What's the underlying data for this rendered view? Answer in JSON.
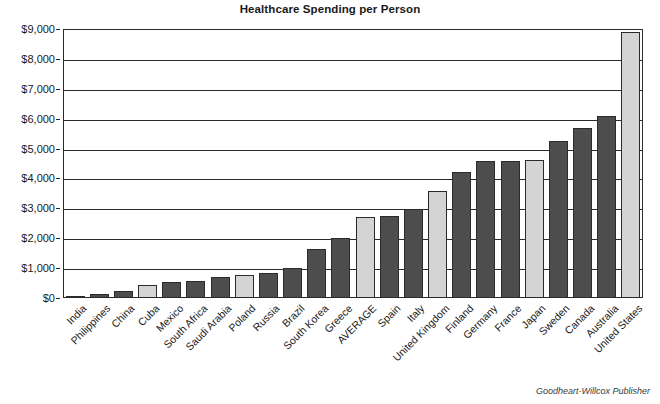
{
  "chart_data": {
    "type": "bar",
    "title": "Healthcare Spending per Person",
    "xlabel": "",
    "ylabel": "",
    "ylim": [
      0,
      9000
    ],
    "ytick_labels": [
      "$9,000",
      "$8,000",
      "$7,000",
      "$6,000",
      "$5,000",
      "$4,000",
      "$3,000",
      "$2,000",
      "$1,000",
      "$0"
    ],
    "ytick_values": [
      9000,
      8000,
      7000,
      6000,
      5000,
      4000,
      3000,
      2000,
      1000,
      0
    ],
    "grid": "horizontal",
    "legend": "none",
    "categories": [
      "India",
      "Philippines",
      "China",
      "Cuba",
      "Mexico",
      "South Africa",
      "Saudi Arabia",
      "Poland",
      "Russia",
      "Brazil",
      "South Korea",
      "Greece",
      "AVERAGE",
      "Spain",
      "Italy",
      "United Kingdom",
      "Finland",
      "Germany",
      "France",
      "Japan",
      "Sweden",
      "Canada",
      "Australia",
      "United States"
    ],
    "values": [
      70,
      130,
      240,
      450,
      550,
      580,
      700,
      760,
      850,
      1000,
      1650,
      2000,
      2700,
      2750,
      2980,
      3580,
      4200,
      4600,
      4600,
      4620,
      5250,
      5680,
      6080,
      8900
    ],
    "bar_styles": [
      "dark",
      "dark",
      "dark",
      "light",
      "dark",
      "dark",
      "dark",
      "light",
      "dark",
      "dark",
      "dark",
      "dark",
      "light",
      "dark",
      "dark",
      "light",
      "dark",
      "dark",
      "dark",
      "light",
      "dark",
      "dark",
      "dark",
      "light"
    ]
  },
  "colors": {
    "bar_dark": "#4d4d4d",
    "bar_light": "#d4d4d4",
    "axis": "#2b2b2b",
    "background": "#ffffff"
  },
  "credit": "Goodheart-Willcox Publisher"
}
